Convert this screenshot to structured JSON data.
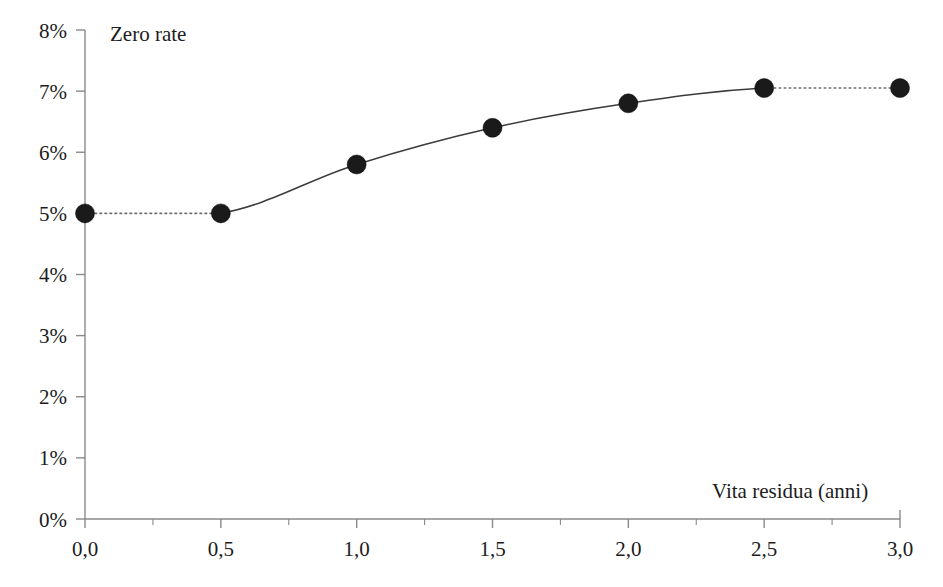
{
  "chart_data": {
    "type": "line",
    "title": "",
    "subtitle": "",
    "xlabel": "Vita residua (anni)",
    "ylabel": "Zero rate",
    "x": [
      0.0,
      0.5,
      1.0,
      1.5,
      2.0,
      2.5,
      3.0
    ],
    "values": [
      5.0,
      5.0,
      5.8,
      6.4,
      6.8,
      7.05,
      7.05
    ],
    "series": [
      {
        "name": "Zero rate",
        "x": [
          0.0,
          0.5,
          1.0,
          1.5,
          2.0,
          2.5,
          3.0
        ],
        "values": [
          5.0,
          5.0,
          5.8,
          6.4,
          6.8,
          7.05,
          7.05
        ],
        "marker": "filled-circle",
        "marker_color": "#1a1a1a",
        "line_color": "#3b3b3b",
        "segment_styles": [
          "dotted",
          "solid",
          "solid",
          "solid",
          "solid",
          "dotted"
        ]
      }
    ],
    "xlim": [
      0.0,
      3.0
    ],
    "ylim": [
      0.0,
      8.0
    ],
    "xticks": [
      0.0,
      0.5,
      1.0,
      1.5,
      2.0,
      2.5,
      3.0
    ],
    "xtick_labels": [
      "0,0",
      "0,5",
      "1,0",
      "1,5",
      "2,0",
      "2,5",
      "3,0"
    ],
    "x_minor_ticks": [
      0.25,
      0.75,
      1.25,
      1.75,
      2.25,
      2.75
    ],
    "yticks": [
      0,
      1,
      2,
      3,
      4,
      5,
      6,
      7,
      8
    ],
    "ytick_labels": [
      "0%",
      "1%",
      "2%",
      "3%",
      "4%",
      "5%",
      "6%",
      "7%",
      "8%"
    ],
    "grid": false,
    "legend": null,
    "legend_position": "none",
    "annotations": []
  },
  "labels": {
    "y_axis_title": "Zero rate",
    "x_axis_title": "Vita residua (anni)"
  },
  "colors": {
    "axis": "#8a8a8a",
    "line": "#3b3b3b",
    "dotted_line": "#6d6d6d",
    "marker": "#1a1a1a",
    "text": "#1c1c1c",
    "background": "#ffffff"
  }
}
